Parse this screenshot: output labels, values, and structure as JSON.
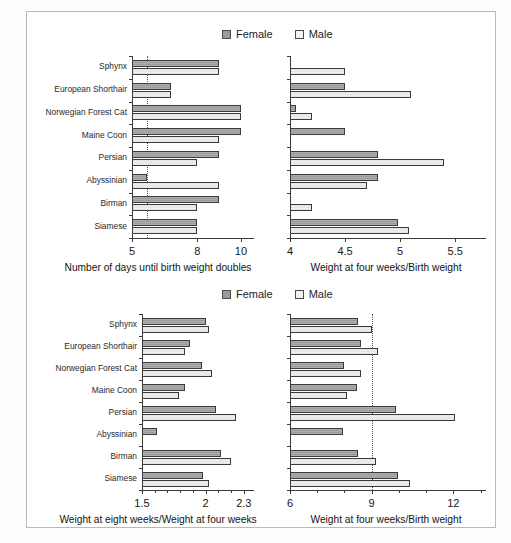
{
  "figure": {
    "background": "#ffffff",
    "frame_color": "#b9b9b9",
    "female_color": "#9c9c9c",
    "male_color": "#eeeeee",
    "legend_top": {
      "female": "Female",
      "male": "Male"
    },
    "legend_bottom": {
      "female": "Female",
      "male": "Male"
    }
  },
  "chart_data": [
    {
      "type": "bar",
      "id": "days-until-birth-weight-doubles",
      "orientation": "horizontal",
      "title": "",
      "xlabel": "Number of days until birth weight doubles",
      "ylabel": "",
      "xlim": [
        5,
        10.6
      ],
      "xticks": [
        5,
        8,
        10
      ],
      "xtick_labels": [
        "5",
        "8",
        "10"
      ],
      "gridlines": [
        5.7
      ],
      "grid": "dotted-vertical",
      "legend_position": "top-center",
      "categories": [
        "Sphynx",
        "European Shorthair",
        "Norwegian Forest Cat",
        "Maine Coon",
        "Persian",
        "Abyssinian",
        "Birman",
        "Siamese"
      ],
      "series": [
        {
          "name": "Female",
          "values": [
            9.0,
            6.8,
            10.0,
            10.0,
            9.0,
            5.7,
            9.0,
            8.0
          ]
        },
        {
          "name": "Male",
          "values": [
            9.0,
            6.8,
            10.0,
            9.0,
            8.0,
            9.0,
            8.0,
            8.0
          ]
        }
      ]
    },
    {
      "type": "bar",
      "id": "weight-four-weeks-over-birth-weight-top",
      "orientation": "horizontal",
      "title": "",
      "xlabel": "Weight at four weeks/Birth weight",
      "ylabel": "",
      "xlim": [
        4,
        5.78
      ],
      "xticks": [
        4,
        4.5,
        5,
        5.5
      ],
      "xtick_labels": [
        "4",
        "4.5",
        "5",
        "5.5"
      ],
      "gridlines": [],
      "grid": "none",
      "legend_position": "top-center",
      "categories": [
        "Sphynx",
        "European Shorthair",
        "Norwegian Forest Cat",
        "Maine Coon",
        "Persian",
        "Abyssinian",
        "Birman",
        "Siamese"
      ],
      "series": [
        {
          "name": "Female",
          "values": [
            null,
            4.5,
            4.05,
            4.5,
            4.8,
            4.8,
            null,
            4.98
          ]
        },
        {
          "name": "Male",
          "values": [
            4.5,
            5.1,
            4.2,
            null,
            5.4,
            4.7,
            4.2,
            5.08
          ]
        }
      ]
    },
    {
      "type": "bar",
      "id": "weight-eight-weeks-over-four-weeks",
      "orientation": "horizontal",
      "title": "",
      "xlabel": "Weight at eight weeks/Weight at four weeks",
      "ylabel": "",
      "xlim": [
        1.5,
        2.38
      ],
      "xticks": [
        1.5,
        2,
        2.3
      ],
      "xtick_labels": [
        "1.5",
        "2",
        "2.3"
      ],
      "minor_xticks": [
        1.6,
        1.7,
        1.8,
        1.9,
        2.1,
        2.2
      ],
      "gridlines": [],
      "grid": "none",
      "legend_position": "top-center",
      "categories": [
        "Sphynx",
        "European Shorthair",
        "Norwegian Forest Cat",
        "Maine Coon",
        "Persian",
        "Abyssinian",
        "Birman",
        "Siamese"
      ],
      "series": [
        {
          "name": "Female",
          "values": [
            2.0,
            1.88,
            1.97,
            1.84,
            2.08,
            1.62,
            2.12,
            1.98
          ]
        },
        {
          "name": "Male",
          "values": [
            2.03,
            1.84,
            2.05,
            1.79,
            2.24,
            null,
            2.2,
            2.03
          ]
        }
      ]
    },
    {
      "type": "bar",
      "id": "weight-four-weeks-over-birth-weight-bottom",
      "orientation": "horizontal",
      "title": "",
      "xlabel": "Weight at four weeks/Birth weight",
      "ylabel": "",
      "xlim": [
        6,
        13.2
      ],
      "xticks": [
        6,
        9,
        12
      ],
      "xtick_labels": [
        "6",
        "9",
        "12"
      ],
      "minor_xticks": [
        7,
        8,
        10,
        11,
        13
      ],
      "gridlines": [
        9
      ],
      "grid": "dotted-vertical",
      "legend_position": "top-center",
      "categories": [
        "Sphynx",
        "European Shorthair",
        "Norwegian Forest Cat",
        "Maine Coon",
        "Persian",
        "Abyssinian",
        "Birman",
        "Siamese"
      ],
      "series": [
        {
          "name": "Female",
          "values": [
            8.5,
            8.6,
            8.0,
            8.45,
            9.9,
            7.95,
            8.5,
            9.95
          ]
        },
        {
          "name": "Male",
          "values": [
            9.0,
            9.25,
            8.6,
            8.1,
            12.05,
            null,
            9.15,
            10.4
          ]
        }
      ]
    }
  ]
}
